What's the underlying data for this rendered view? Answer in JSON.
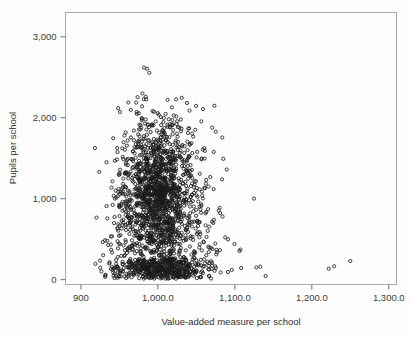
{
  "figure": {
    "name": "scatter-plot-pupils-vs-value-added",
    "background_color": "#fefefe",
    "frame_color": "#a9a9a9",
    "marker_color": "#1a1a1a",
    "text_color": "#2e2e2e"
  },
  "chart_data": {
    "type": "scatter",
    "title": "",
    "subtitle": "",
    "xlabel": "Value-added measure per school",
    "ylabel": "Pupils per school",
    "xlim": [
      880,
      1310
    ],
    "ylim": [
      -60,
      3300
    ],
    "grid": false,
    "legend": null,
    "legend_position": "none",
    "marker": "open-circle",
    "marker_size_px": 3.2,
    "x_ticks": [
      900,
      1000,
      1100,
      1200,
      1300
    ],
    "x_tick_labels": [
      "900",
      "1,000.0",
      "1,100.0",
      "1,200.0",
      "1,300.0"
    ],
    "y_ticks": [
      0,
      1000,
      2000,
      3000
    ],
    "y_tick_labels": [
      "0",
      "1,000",
      "2,000",
      "3,000"
    ],
    "n_points": 2100,
    "annotations": [],
    "clusters": [
      {
        "name": "secondary-schools-main-cloud",
        "n": 1150,
        "x_center": 1000,
        "x_spread": 22,
        "y_center": 1050,
        "y_spread": 330,
        "y_min": 300,
        "y_max": 2250
      },
      {
        "name": "main-cloud-upper-tail",
        "n": 170,
        "x_center": 1005,
        "x_spread": 26,
        "y_center": 1750,
        "y_spread": 260,
        "y_min": 1300,
        "y_max": 2300
      },
      {
        "name": "primary-schools-low-band",
        "n": 520,
        "x_center": 1005,
        "x_spread": 30,
        "y_center": 140,
        "y_spread": 85,
        "y_min": 10,
        "y_max": 420
      },
      {
        "name": "mid-band-sparse",
        "n": 170,
        "x_center": 1002,
        "x_spread": 34,
        "y_center": 470,
        "y_spread": 150,
        "y_min": 200,
        "y_max": 820
      },
      {
        "name": "right-tail-spread",
        "n": 95,
        "x_center": 1048,
        "x_spread": 22,
        "y_center": 820,
        "y_spread": 400,
        "y_min": 100,
        "y_max": 1700
      },
      {
        "name": "left-tail-spread",
        "n": 70,
        "x_center": 963,
        "x_spread": 13,
        "y_center": 950,
        "y_spread": 400,
        "y_min": 150,
        "y_max": 1900
      }
    ],
    "outliers": [
      {
        "x": 982,
        "y": 2620
      },
      {
        "x": 986,
        "y": 2605
      },
      {
        "x": 989,
        "y": 2555
      },
      {
        "x": 980,
        "y": 2300
      },
      {
        "x": 919,
        "y": 195
      },
      {
        "x": 932,
        "y": 60
      },
      {
        "x": 941,
        "y": 120
      },
      {
        "x": 948,
        "y": 135
      },
      {
        "x": 1222,
        "y": 135
      },
      {
        "x": 1229,
        "y": 165
      },
      {
        "x": 1250,
        "y": 230
      },
      {
        "x": 1140,
        "y": 45
      },
      {
        "x": 1128,
        "y": 150
      },
      {
        "x": 1133,
        "y": 160
      },
      {
        "x": 1106,
        "y": 355
      },
      {
        "x": 1096,
        "y": 120
      },
      {
        "x": 1091,
        "y": 95
      },
      {
        "x": 1084,
        "y": 780
      },
      {
        "x": 1079,
        "y": 855
      },
      {
        "x": 1072,
        "y": 700
      }
    ]
  }
}
